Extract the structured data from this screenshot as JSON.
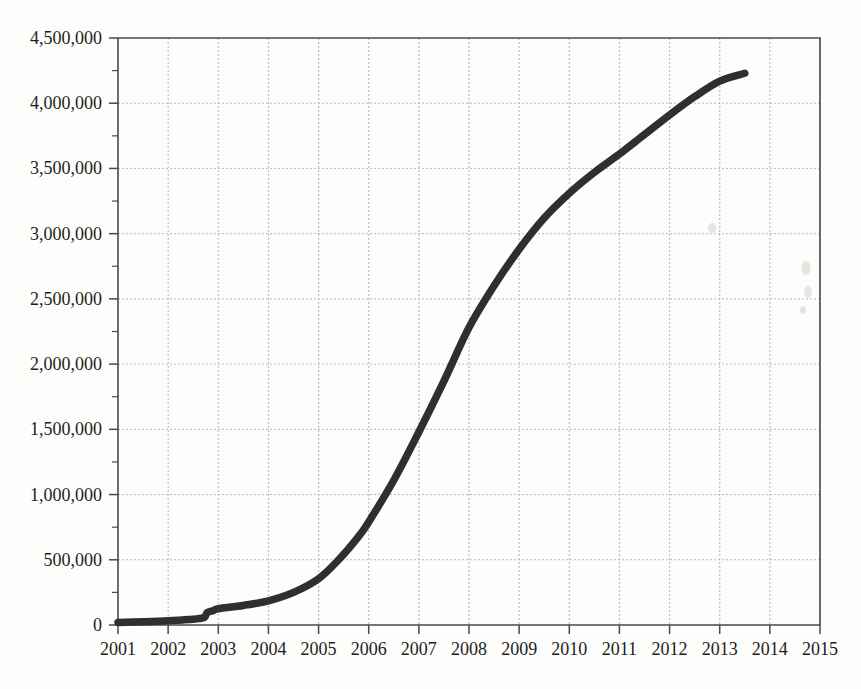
{
  "chart_data": {
    "type": "line",
    "title": "",
    "subtitle": "",
    "xlabel": "",
    "ylabel": "",
    "xlim": [
      2001,
      2015
    ],
    "ylim": [
      0,
      4500000
    ],
    "grid": true,
    "legend": null,
    "y_major_step": 500000,
    "y_minor_step": 250000,
    "x_tick_labels": [
      "2001",
      "2002",
      "2003",
      "2004",
      "2005",
      "2006",
      "2007",
      "2008",
      "2009",
      "2010",
      "2011",
      "2012",
      "2013",
      "2014",
      "2015"
    ],
    "y_tick_labels": [
      "0",
      "500,000",
      "1,000,000",
      "1,500,000",
      "2,000,000",
      "2,500,000",
      "3,000,000",
      "3,500,000",
      "4,000,000",
      "4,500,000"
    ],
    "y_tick_values": [
      0,
      500000,
      1000000,
      1500000,
      2000000,
      2500000,
      3000000,
      3500000,
      4000000,
      4500000
    ],
    "series": [
      {
        "name": "cumulative total",
        "color": "#2f2f2f",
        "x": [
          2001,
          2001.5,
          2002,
          2002.4,
          2002.7,
          2002.78,
          2002.9,
          2003,
          2003.5,
          2004,
          2004.5,
          2005,
          2005.4,
          2005.8,
          2006,
          2006.5,
          2007,
          2007.5,
          2008,
          2008.5,
          2009,
          2009.5,
          2010,
          2010.5,
          2011,
          2011.5,
          2012,
          2012.5,
          2013,
          2013.5
        ],
        "y": [
          20000,
          25000,
          32000,
          42000,
          55000,
          95000,
          110000,
          125000,
          150000,
          185000,
          250000,
          355000,
          500000,
          680000,
          790000,
          1110000,
          1480000,
          1870000,
          2280000,
          2600000,
          2880000,
          3120000,
          3310000,
          3470000,
          3610000,
          3760000,
          3910000,
          4050000,
          4170000,
          4230000
        ]
      }
    ]
  },
  "axes": {
    "x_axis_name": "year-axis",
    "y_axis_name": "value-axis"
  }
}
